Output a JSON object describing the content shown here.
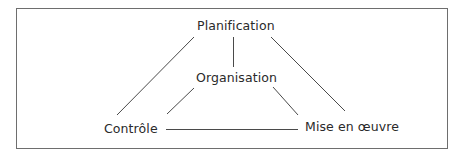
{
  "diagram": {
    "nodes": {
      "planification": "Planification",
      "organisation": "Organisation",
      "controle": "Contrôle",
      "mise_en_oeuvre": "Mise en œuvre"
    },
    "edges": [
      {
        "from": "Planification",
        "to": "Contrôle"
      },
      {
        "from": "Planification",
        "to": "Organisation"
      },
      {
        "from": "Planification",
        "to": "Mise en œuvre"
      },
      {
        "from": "Organisation",
        "to": "Contrôle"
      },
      {
        "from": "Organisation",
        "to": "Mise en œuvre"
      },
      {
        "from": "Contrôle",
        "to": "Mise en œuvre"
      }
    ],
    "colors": {
      "line": "#4a4a4a",
      "border": "#6e6e6e",
      "text": "#2a2a2a"
    }
  }
}
